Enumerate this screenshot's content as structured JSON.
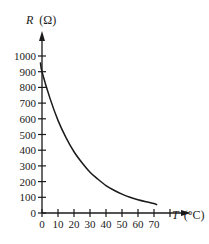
{
  "chart_data": {
    "type": "line",
    "title": "",
    "xlabel": "T (°C)",
    "ylabel": "R (Ω)",
    "xlabel_var": "T",
    "xlabel_unit": "(°C)",
    "ylabel_var": "R",
    "ylabel_unit": "(Ω)",
    "x_ticks": [
      0,
      10,
      20,
      30,
      40,
      50,
      60,
      70,
      80
    ],
    "x_tick_labels": [
      "0",
      "10",
      "20",
      "30",
      "40",
      "50",
      "60",
      "70"
    ],
    "y_ticks": [
      0,
      100,
      200,
      300,
      400,
      500,
      600,
      700,
      800,
      900,
      1000
    ],
    "y_tick_labels": [
      "0",
      "100",
      "200",
      "300",
      "400",
      "500",
      "600",
      "700",
      "800",
      "900",
      "1000"
    ],
    "xlim": [
      0,
      80
    ],
    "ylim": [
      0,
      1000
    ],
    "grid": false,
    "legend": null,
    "series": [
      {
        "name": "Resistance vs Temperature",
        "color": "#1a1a1a",
        "x": [
          -1,
          0,
          5,
          10,
          15,
          20,
          25,
          30,
          35,
          40,
          45,
          50,
          55,
          60,
          65,
          70,
          72
        ],
        "y": [
          960,
          900,
          730,
          590,
          480,
          390,
          320,
          260,
          215,
          175,
          145,
          120,
          100,
          85,
          72,
          60,
          52
        ]
      }
    ]
  }
}
